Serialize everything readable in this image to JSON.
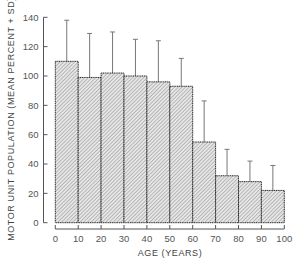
{
  "chart_data": {
    "type": "bar",
    "title": "",
    "xlabel": "AGE (YEARS)",
    "ylabel": "MOTOR UNIT POPULATION (MEAN PERCENT + SD)",
    "categories": [
      "0-10",
      "10-20",
      "20-30",
      "30-40",
      "40-50",
      "50-60",
      "60-70",
      "70-80",
      "80-90",
      "90-100"
    ],
    "bin_edges": [
      0,
      10,
      20,
      30,
      40,
      50,
      60,
      70,
      80,
      90,
      100
    ],
    "series": [
      {
        "name": "Mean percent",
        "values": [
          110,
          99,
          102,
          100,
          96,
          93,
          55,
          32,
          28,
          22
        ],
        "sd_upper": [
          138,
          129,
          130,
          125,
          124,
          112,
          83,
          50,
          42,
          39
        ]
      }
    ],
    "xticks": [
      0,
      10,
      20,
      30,
      40,
      50,
      60,
      70,
      80,
      90,
      100
    ],
    "yticks": [
      0,
      20,
      40,
      60,
      80,
      100,
      120,
      140
    ],
    "xlim": [
      0,
      100
    ],
    "ylim": [
      0,
      140
    ],
    "grid": false,
    "legend": "none",
    "bar_fill": "diagonal-hatch",
    "colors": {
      "bar_edge": "#2a2a2a",
      "hatch": "#8a8a8a",
      "axis": "#555555",
      "error_bar": "#777777"
    }
  }
}
